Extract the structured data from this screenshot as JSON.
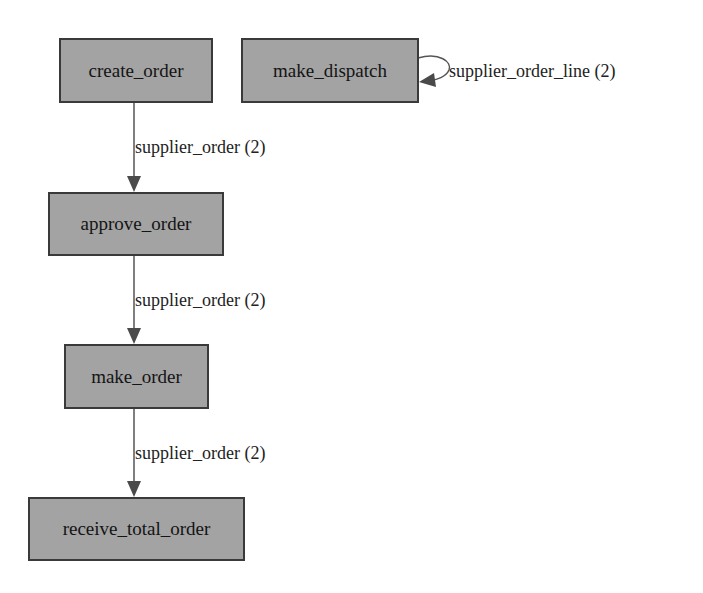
{
  "graph": {
    "nodes": [
      {
        "id": "create_order",
        "label": "create_order"
      },
      {
        "id": "make_dispatch",
        "label": "make_dispatch"
      },
      {
        "id": "approve_order",
        "label": "approve_order"
      },
      {
        "id": "make_order",
        "label": "make_order"
      },
      {
        "id": "receive_total_order",
        "label": "receive_total_order"
      }
    ],
    "edges": [
      {
        "from": "create_order",
        "to": "approve_order",
        "label": "supplier_order (2)"
      },
      {
        "from": "approve_order",
        "to": "make_order",
        "label": "supplier_order (2)"
      },
      {
        "from": "make_order",
        "to": "receive_total_order",
        "label": "supplier_order (2)"
      },
      {
        "from": "make_dispatch",
        "to": "make_dispatch",
        "label": "supplier_order_line (2)"
      }
    ]
  },
  "colors": {
    "node_fill": "#a3a3a3",
    "node_border": "#3a3a3a",
    "edge": "#555555"
  }
}
